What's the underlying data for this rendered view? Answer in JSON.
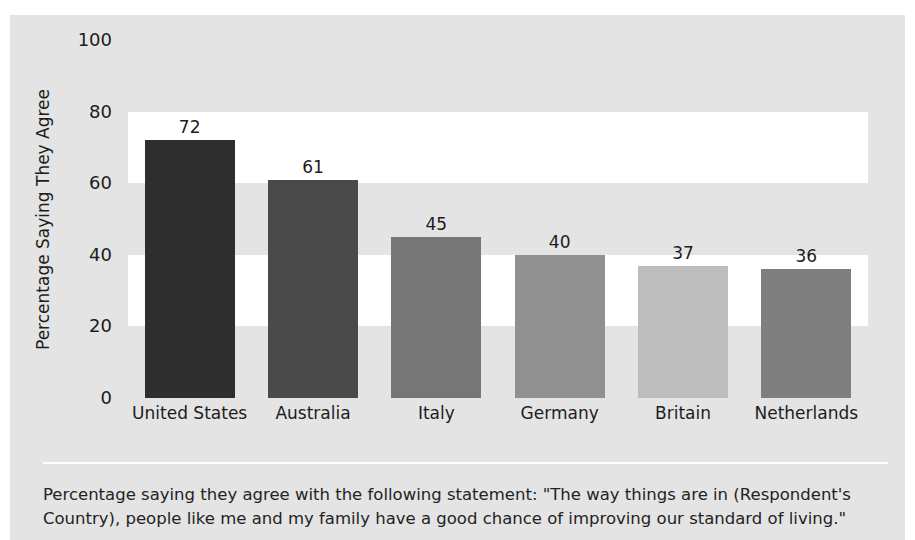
{
  "chart_data": {
    "type": "bar",
    "title": "",
    "subtitle": "",
    "xlabel": "",
    "ylabel": "Percentage Saying They Agree",
    "categories": [
      "United States",
      "Australia",
      "Italy",
      "Germany",
      "Britain",
      "Netherlands"
    ],
    "values": [
      72,
      61,
      45,
      40,
      37,
      36
    ],
    "value_labels": [
      "72",
      "61",
      "45",
      "40",
      "37",
      "36"
    ],
    "bar_colors": [
      "#2e2e2e",
      "#4a4a4a",
      "#767676",
      "#909090",
      "#bdbdbd",
      "#7f7f7f"
    ],
    "ylim": [
      0,
      100
    ],
    "yticks": [
      0,
      20,
      40,
      60,
      80,
      100
    ],
    "ytick_labels": [
      "0",
      "20",
      "40",
      "60",
      "80",
      "100"
    ],
    "grid": "alternating-horizontal-bands",
    "band_color_gray": "#e4e4e4",
    "band_color_white": "#ffffff",
    "legend": "none",
    "legend_position": "none",
    "panel_background": "#e4e4e4",
    "text_color": "#1c1c1c",
    "annotation": "Percentage saying they agree with the following statement: \"The way things are in (Respondent's Country), people like me and my family have a good chance of improving our standard of living.\""
  },
  "caption": {
    "line1": "Percentage saying they agree with the following statement: \"The way things are in (Respondent's",
    "line2": "Country), people like me and my family have a good chance of improving our standard of living.\""
  }
}
